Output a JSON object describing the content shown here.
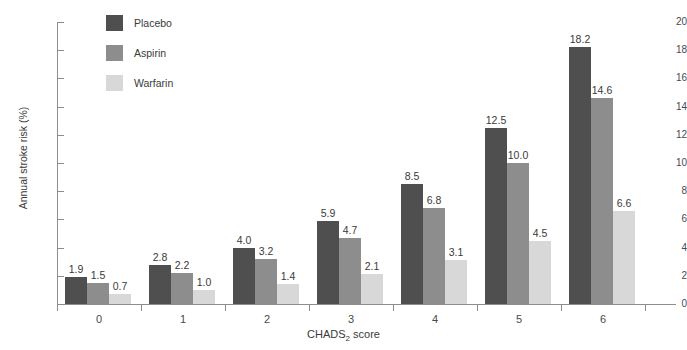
{
  "chart_data": {
    "type": "bar",
    "title": "",
    "xlabel": "CHADS2 score",
    "xlabel_prefix": "CHADS",
    "xlabel_sub": "2",
    "xlabel_suffix": " score",
    "ylabel": "Annual stroke risk (%)",
    "categories": [
      "0",
      "1",
      "2",
      "3",
      "4",
      "5",
      "6"
    ],
    "series": [
      {
        "name": "Placebo",
        "color": "#4f4f4f",
        "values": [
          1.9,
          2.8,
          4.0,
          5.9,
          8.5,
          12.5,
          18.2
        ]
      },
      {
        "name": "Aspirin",
        "color": "#8d8d8d",
        "values": [
          1.5,
          2.2,
          3.2,
          4.7,
          6.8,
          10.0,
          14.6
        ]
      },
      {
        "name": "Warfarin",
        "color": "#d8d8d8",
        "values": [
          0.7,
          1.0,
          1.4,
          2.1,
          3.1,
          4.5,
          6.6
        ]
      }
    ],
    "value_labels": [
      [
        "1.9",
        "1.5",
        "0.7"
      ],
      [
        "2.8",
        "2.2",
        "1.0"
      ],
      [
        "4.0",
        "3.2",
        "1.4"
      ],
      [
        "5.9",
        "4.7",
        "2.1"
      ],
      [
        "8.5",
        "6.8",
        "3.1"
      ],
      [
        "12.5",
        "10.0",
        "4.5"
      ],
      [
        "18.2",
        "14.6",
        "6.6"
      ]
    ],
    "ylim": [
      0,
      20
    ],
    "yticks": [
      0,
      2,
      4,
      6,
      8,
      10,
      12,
      14,
      16,
      18,
      20
    ],
    "ytick_labels": [
      "0",
      "2",
      "4",
      "6",
      "8",
      "10",
      "12",
      "14",
      "16",
      "18",
      "20"
    ],
    "grid": false,
    "legend_position": "top-left",
    "legend": [
      "Placebo",
      "Aspirin",
      "Warfarin"
    ]
  },
  "axis_colors": {
    "axis_line": "#8d8d8d",
    "text": "#3a3a3a",
    "background": "#ffffff"
  }
}
